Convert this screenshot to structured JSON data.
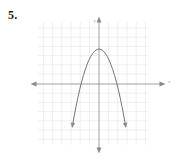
{
  "problem": {
    "number_label": "5.",
    "prompt": ""
  },
  "figure": {
    "kind": "coordinate-plane-graph",
    "axis_labels": {
      "x": "x",
      "y": "y"
    },
    "colors": {
      "grid": "#e9e7ea",
      "grid_minor": "#f1eff2",
      "axis": "#8f8f93",
      "curve": "#6e6e72",
      "text": "#1a1a1a",
      "background": "#ffffff"
    },
    "grid": {
      "visible": true,
      "cell_px": 9.2,
      "left_px": 38,
      "top_px": 22,
      "right_px": 148,
      "bottom_px": 145
    },
    "axes": {
      "x_axis_y_px": 84,
      "y_axis_x_px": 99,
      "x_arrow_left_px": 32,
      "x_arrow_right_px": 164,
      "y_arrow_top_px": 17,
      "y_arrow_bottom_px": 152,
      "arrowheads": [
        "left",
        "right",
        "up",
        "down"
      ]
    }
  },
  "chart_data": {
    "type": "line",
    "title": "",
    "subtitle": "",
    "xlabel": "x",
    "ylabel": "y",
    "xlim": [
      -6.6,
      7.1
    ],
    "ylim": [
      -7.3,
      6.7
    ],
    "grid": true,
    "legend": false,
    "legend_position": "none",
    "annotations": [],
    "series": [
      {
        "name": "downward parabola",
        "equation": "y = -x^2 + 3.8",
        "vertex": [
          0,
          3.8
        ],
        "roots": [
          -1.95,
          1.95
        ],
        "opens": "down",
        "x": [
          -2.9,
          -2.7,
          -2.5,
          -2.3,
          -2.1,
          -1.9,
          -1.7,
          -1.5,
          -1.3,
          -1.1,
          -0.9,
          -0.7,
          -0.5,
          -0.3,
          -0.1,
          0.1,
          0.3,
          0.5,
          0.7,
          0.9,
          1.1,
          1.3,
          1.5,
          1.7,
          1.9,
          2.1,
          2.3,
          2.5,
          2.7,
          2.9
        ],
        "y": [
          -4.61,
          -3.49,
          -2.45,
          -1.49,
          -0.61,
          0.19,
          0.91,
          1.55,
          2.11,
          2.59,
          2.99,
          3.31,
          3.55,
          3.71,
          3.79,
          3.79,
          3.71,
          3.55,
          3.31,
          2.99,
          2.59,
          2.11,
          1.55,
          0.91,
          0.19,
          -0.61,
          -1.49,
          -2.45,
          -3.49,
          -4.61
        ],
        "endpoint_arrowheads": [
          "down-left",
          "down-right"
        ]
      }
    ],
    "xticks": [
      -6,
      -5,
      -4,
      -3,
      -2,
      -1,
      0,
      1,
      2,
      3,
      4,
      5,
      6
    ],
    "yticks": [
      -6,
      -5,
      -4,
      -3,
      -2,
      -1,
      0,
      1,
      2,
      3,
      4,
      5,
      6
    ],
    "xticklabels": [
      "",
      "",
      "",
      "",
      "",
      "",
      "",
      "",
      "",
      "",
      "",
      "",
      ""
    ],
    "yticklabels": [
      "",
      "",
      "",
      "",
      "",
      "",
      "",
      "",
      "",
      "",
      "",
      "",
      ""
    ]
  }
}
